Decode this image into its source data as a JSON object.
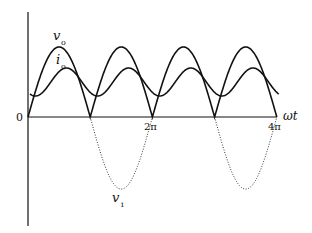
{
  "chart_data": {
    "type": "line",
    "title": "",
    "xlabel": "ωt",
    "ylabel": "",
    "x_ticks": [
      "0",
      "2π",
      "4π"
    ],
    "series": [
      {
        "name": "v_o",
        "style": "solid",
        "description": "full-wave rectified sine, |sin ωt|, peak ≈ 1.0"
      },
      {
        "name": "i_o",
        "style": "solid",
        "description": "smoothed load current, min ≈ 0.3 at multiples of π, max ≈ 0.7 lagging vo peak"
      },
      {
        "name": "v_i",
        "style": "dotted",
        "description": "negative half-cycles of input sine, shown dotted between π–2π and 3π–4π"
      }
    ],
    "x_range": [
      "0",
      "4π"
    ],
    "grid": false
  },
  "labels": {
    "origin": "0",
    "tick_2pi": "2π",
    "tick_4pi": "4π",
    "x_axis": "ωt",
    "vo": "v",
    "vo_sub": "o",
    "io": "i",
    "io_sub": "o",
    "vi": "v",
    "vi_sub": "i"
  }
}
